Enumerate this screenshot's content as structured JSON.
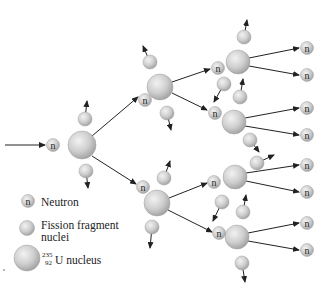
{
  "diagram": {
    "type": "nuclear-chain-reaction",
    "neutron_symbol": "n",
    "colors": {
      "sphere_fill": "#c8c8c8",
      "sphere_highlight": "#f2f2f2",
      "sphere_edge": "#9a9a9a",
      "arrow": "#222222",
      "text": "#222222"
    },
    "nodes": {
      "incoming_neutron": {
        "x": 53,
        "y": 145
      },
      "uranium": [
        {
          "id": "U1",
          "x": 82,
          "y": 145,
          "r": 14,
          "generation": 1
        },
        {
          "id": "U2a",
          "x": 160,
          "y": 87,
          "r": 13,
          "generation": 2
        },
        {
          "id": "U2b",
          "x": 157,
          "y": 203,
          "r": 13,
          "generation": 2
        },
        {
          "id": "U3a",
          "x": 238,
          "y": 62,
          "r": 12,
          "generation": 3
        },
        {
          "id": "U3b",
          "x": 234,
          "y": 122,
          "r": 12,
          "generation": 3
        },
        {
          "id": "U3c",
          "x": 235,
          "y": 177,
          "r": 12,
          "generation": 3
        },
        {
          "id": "U3d",
          "x": 237,
          "y": 237,
          "r": 12,
          "generation": 3
        }
      ],
      "output_neutrons": [
        {
          "x": 307,
          "y": 48
        },
        {
          "x": 307,
          "y": 75
        },
        {
          "x": 307,
          "y": 108
        },
        {
          "x": 307,
          "y": 135
        },
        {
          "x": 307,
          "y": 165
        },
        {
          "x": 307,
          "y": 192
        },
        {
          "x": 307,
          "y": 223
        },
        {
          "x": 307,
          "y": 250
        }
      ]
    }
  },
  "legend": {
    "items": [
      {
        "icon": "neutron-icon",
        "label": "Neutron"
      },
      {
        "icon": "fission-fragment-icon",
        "label_line1": "Fission fragment",
        "label_line2": "nuclei"
      },
      {
        "icon": "uranium-nucleus-icon",
        "mass_number": "235",
        "atomic_number": "92",
        "label": "U nucleus"
      }
    ]
  }
}
